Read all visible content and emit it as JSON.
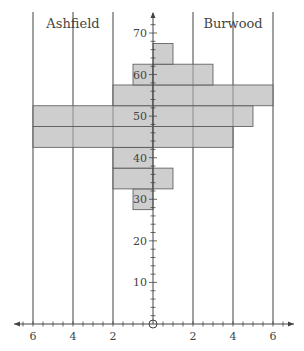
{
  "chart_data": {
    "type": "bar",
    "subtype": "back-to-back histogram",
    "title": "",
    "xlabel": "",
    "ylabel": "",
    "left_group": "Ashfield",
    "right_group": "Burwood",
    "bin_width": 5,
    "categories": [
      30,
      35,
      40,
      45,
      50,
      55,
      60,
      65
    ],
    "series": [
      {
        "name": "Ashfield",
        "side": "left",
        "values": [
          1,
          2,
          2,
          6,
          6,
          2,
          1,
          0
        ]
      },
      {
        "name": "Burwood",
        "side": "right",
        "values": [
          0,
          1,
          0,
          4,
          5,
          6,
          3,
          1
        ]
      }
    ],
    "x_ticks_left": [
      "6",
      "4",
      "2"
    ],
    "x_ticks_right": [
      "2",
      "4",
      "6"
    ],
    "y_ticks": [
      "10",
      "20",
      "30",
      "40",
      "50",
      "60",
      "70"
    ],
    "xlim": [
      -7,
      7
    ],
    "ylim": [
      0,
      72
    ],
    "grid": "vertical lines at 2, 4, 6 on each side",
    "legend": "group labels at top",
    "colors": {
      "bar_fill": "#c6c6c6",
      "bar_stroke": "#555555",
      "axis": "#444444",
      "grid": "#666666"
    }
  }
}
